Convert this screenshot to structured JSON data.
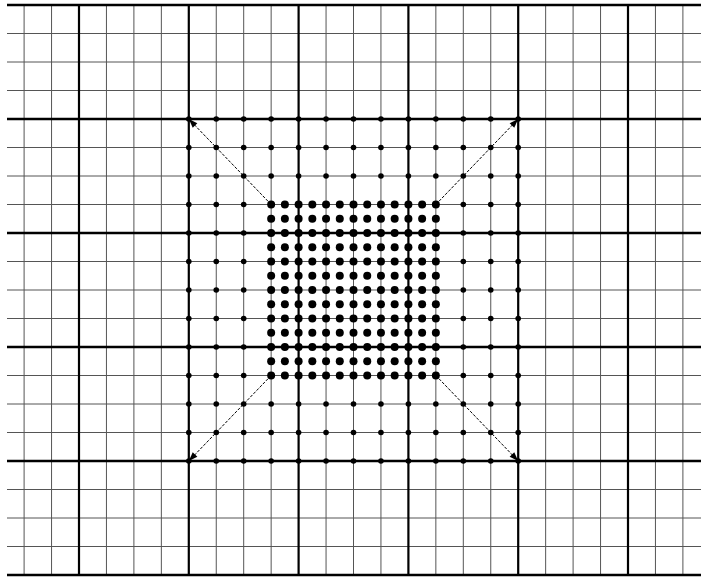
{
  "diagram": {
    "type": "grid-refinement",
    "grid": {
      "columns": 25,
      "rows": 20,
      "major_every": 4
    },
    "outer_region": {
      "label": "coarse-sample-points",
      "cols": 13,
      "rows": 13,
      "dot_style": "small"
    },
    "inner_region": {
      "label": "fine-sample-points",
      "cols": 13,
      "rows": 13,
      "dot_style": "large"
    },
    "arrows": [
      {
        "name": "arrow-top-left",
        "from": "inner-top-left",
        "to": "outer-top-left"
      },
      {
        "name": "arrow-top-right",
        "from": "inner-top-right",
        "to": "outer-top-right"
      },
      {
        "name": "arrow-bottom-left",
        "from": "inner-bottom-left",
        "to": "outer-bottom-left"
      },
      {
        "name": "arrow-bottom-right",
        "from": "inner-bottom-right",
        "to": "outer-bottom-right"
      }
    ],
    "colors": {
      "background": "#ffffff",
      "line": "#000000",
      "minor_line": "#555555",
      "dot": "#000000"
    }
  }
}
